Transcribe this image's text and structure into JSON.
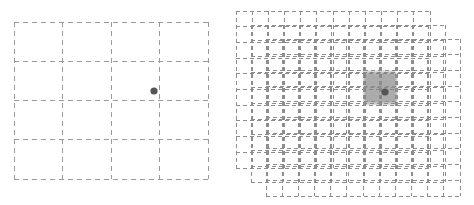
{
  "figure": {
    "width": 474,
    "height": 205,
    "background": "#ffffff"
  },
  "style": {
    "grid_line_color": "#9a9a9a",
    "grid_line_width": 1,
    "dash_pattern": "4 3",
    "point_color": "#555555",
    "point_radius": 3.6,
    "highlight_color": "#808080",
    "highlight_opacity": 0.32
  },
  "panels": [
    {
      "id": "coarse-grid-panel",
      "name": "left-panel",
      "label": "",
      "layers": [
        {
          "id": "coarse-grid",
          "x": 14,
          "y": 22,
          "width": 194,
          "height": 157,
          "cols": 4,
          "rows": 4,
          "dash": "5 4",
          "color": "#9a9a9a",
          "opacity": 1,
          "highlight": null
        }
      ],
      "points": [
        {
          "name": "query-point",
          "x": 154,
          "y": 91,
          "r": 3.6,
          "color": "#555555"
        }
      ]
    },
    {
      "id": "multi-grid-panel",
      "name": "right-panel",
      "label": "",
      "layers": [
        {
          "id": "grid-layer-1",
          "x": 236,
          "y": 11,
          "width": 194,
          "height": 157,
          "cols": 12,
          "rows": 10,
          "dash": "4 3",
          "color": "#8d8d8d",
          "opacity": 1,
          "highlight": {
            "col": 8,
            "row": 4,
            "cols": 2,
            "rows": 2,
            "color": "#808080",
            "opacity": 0.3
          }
        },
        {
          "id": "grid-layer-2",
          "x": 251,
          "y": 25,
          "width": 194,
          "height": 157,
          "cols": 12,
          "rows": 10,
          "dash": "4 3",
          "color": "#8d8d8d",
          "opacity": 1,
          "highlight": {
            "col": 7,
            "row": 3,
            "cols": 2,
            "rows": 2,
            "color": "#808080",
            "opacity": 0.3
          }
        },
        {
          "id": "grid-layer-3",
          "x": 266,
          "y": 39,
          "width": 194,
          "height": 157,
          "cols": 12,
          "rows": 10,
          "dash": "4 3",
          "color": "#8d8d8d",
          "opacity": 1,
          "highlight": {
            "col": 6,
            "row": 2,
            "cols": 2,
            "rows": 2,
            "color": "#808080",
            "opacity": 0.3
          }
        }
      ],
      "points": [
        {
          "name": "query-point",
          "x": 385,
          "y": 92,
          "r": 3.6,
          "color": "#555555"
        }
      ]
    }
  ]
}
